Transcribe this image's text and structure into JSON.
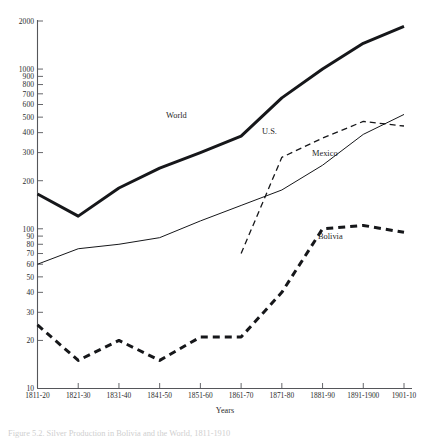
{
  "chart_data": {
    "type": "line",
    "title": "",
    "xlabel": "Years",
    "ylabel": "",
    "yscale": "log",
    "ylim": [
      10,
      2000
    ],
    "grid": false,
    "legend_position": "inline-labels",
    "categories": [
      "1811-20",
      "1821-30",
      "1831-40",
      "1841-50",
      "1851-60",
      "1861-70",
      "1871-80",
      "1881-90",
      "1891-1900",
      "1901-10"
    ],
    "ytick_labels": [
      "2000",
      "1000",
      "900",
      "800",
      "700",
      "600",
      "500",
      "400",
      "300",
      "200",
      "100",
      "90",
      "80",
      "70",
      "60",
      "50",
      "40",
      "30",
      "20",
      "10"
    ],
    "ytick_values": [
      2000,
      1000,
      900,
      800,
      700,
      600,
      500,
      400,
      300,
      200,
      100,
      90,
      80,
      70,
      60,
      50,
      40,
      30,
      20,
      10
    ],
    "series": [
      {
        "name": "World",
        "style": "thick-solid",
        "values": [
          165,
          120,
          180,
          240,
          300,
          380,
          660,
          1000,
          1450,
          1850
        ]
      },
      {
        "name": "Mexico",
        "style": "thin-solid",
        "values": [
          60,
          75,
          80,
          88,
          112,
          140,
          175,
          250,
          390,
          520
        ]
      },
      {
        "name": "U.S.",
        "style": "dashed",
        "values": [
          null,
          null,
          null,
          null,
          null,
          70,
          280,
          370,
          470,
          440
        ]
      },
      {
        "name": "Bolivia",
        "style": "thick-dashed",
        "values": [
          25,
          15,
          20,
          15,
          21,
          21,
          40,
          100,
          105,
          95
        ]
      }
    ]
  },
  "axes": {
    "x_axis_title": "Years"
  },
  "caption": {
    "text": "Figure 5.2. Silver Production in Bolivia and the World, 1811-1910"
  }
}
